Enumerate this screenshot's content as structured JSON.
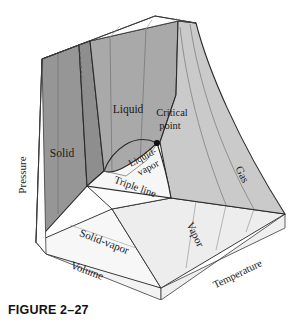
{
  "figure": {
    "caption": "FIGURE 2–27"
  },
  "axes": {
    "pressure": "Pressure",
    "volume": "Volume",
    "temperature": "Temperature"
  },
  "regions": {
    "solid": "Solid",
    "liquid": "Liquid",
    "liquid_vapor_line1": "Liquid-",
    "liquid_vapor_line2": "vapor",
    "solid_vapor": "Solid-vapor",
    "vapor": "Vapor",
    "gas": "Gas",
    "triple_line": "Triple line"
  },
  "points": {
    "critical_line1": "Critical",
    "critical_line2": "point"
  },
  "colors": {
    "solid_face": "#969696",
    "liquid_face": "#a9a9a9",
    "solid_liquid_face": "#8d8d8d",
    "gas_face": "#c9c9c9",
    "vapor_face": "#d8d8d8",
    "dome_face": "#f4f4f4",
    "top_face": "#fbfbfb",
    "base_face": "#fafafa",
    "outline": "#2b2b2b",
    "thin_line": "#5a5a5a",
    "text": "#1a1a1a",
    "background": "#ffffff"
  }
}
